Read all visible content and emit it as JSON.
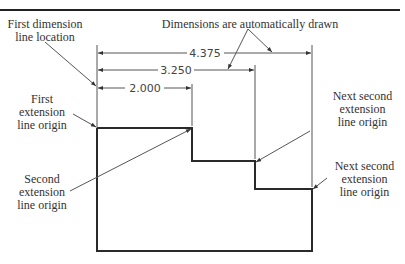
{
  "figure": {
    "type": "baseline dimensioning illustration",
    "colors": {
      "outline": "#2a2a2a",
      "dimension_line": "#555555",
      "leader": "#555555",
      "text": "#333333",
      "rule": "#222222"
    }
  },
  "labels": {
    "first_dimension_line_location": [
      "First dimension",
      "line location"
    ],
    "dimensions_auto_drawn": "Dimensions are automatically drawn",
    "first_extension_line_origin": [
      "First",
      "extension",
      "line origin"
    ],
    "second_extension_line_origin": [
      "Second",
      "extension",
      "line origin"
    ],
    "next_second_extension_1": [
      "Next second",
      "extension",
      "line origin"
    ],
    "next_second_extension_2": [
      "Next second",
      "extension",
      "line origin"
    ]
  },
  "dimensions": [
    {
      "value": "2.000"
    },
    {
      "value": "3.250"
    },
    {
      "value": "4.375"
    }
  ]
}
